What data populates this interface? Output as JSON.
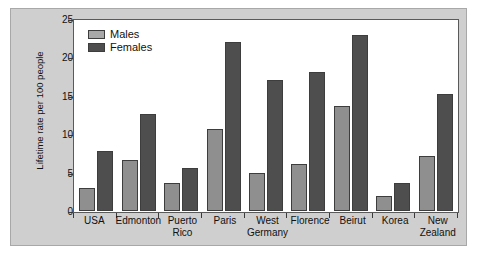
{
  "chart_data": {
    "type": "bar",
    "title": "",
    "xlabel": "",
    "ylabel": "Lifetime rate per 100 people",
    "ylim": [
      0,
      25
    ],
    "yticks": [
      0,
      5,
      10,
      15,
      20,
      25
    ],
    "grid": false,
    "legend_position": "top-left",
    "categories": [
      "USA",
      "Edmonton",
      "Puerto Rico",
      "Paris",
      "West Germany",
      "Florence",
      "Beirut",
      "Korea",
      "New Zealand"
    ],
    "category_lines": [
      [
        "USA"
      ],
      [
        "Edmonton"
      ],
      [
        "Puerto",
        "Rico"
      ],
      [
        "Paris"
      ],
      [
        "West",
        "Germany"
      ],
      [
        "Florence"
      ],
      [
        "Beirut"
      ],
      [
        "Korea"
      ],
      [
        "New",
        "Zealand"
      ]
    ],
    "series": [
      {
        "name": "Males",
        "color": "#8f8f8f",
        "values": [
          3.0,
          6.7,
          3.7,
          10.7,
          5.0,
          6.1,
          13.7,
          2.0,
          7.1
        ]
      },
      {
        "name": "Females",
        "color": "#4e4e4e",
        "values": [
          7.8,
          12.6,
          5.6,
          22.0,
          17.1,
          18.1,
          22.9,
          3.7,
          15.3
        ]
      }
    ]
  }
}
